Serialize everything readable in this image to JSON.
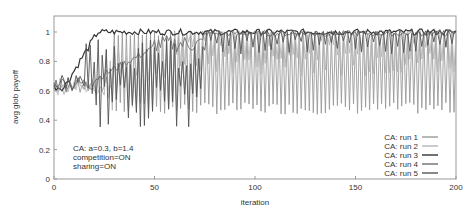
{
  "chart_data": {
    "type": "line",
    "title": "",
    "xlabel": "iteration",
    "ylabel": "avg glob payoff",
    "xlim": [
      0,
      200
    ],
    "ylim": [
      0,
      1.1
    ],
    "x_ticks": [
      "0",
      "50",
      "100",
      "150",
      "200"
    ],
    "y_ticks": [
      "0",
      "0.2",
      "0.4",
      "0.6",
      "0.8",
      "1"
    ],
    "grid": false,
    "legend_position": "lower-right",
    "annotation": [
      "CA: a=0.3, b=1.4",
      "competition=ON",
      "sharing=ON"
    ],
    "series": [
      {
        "name": "CA: run 1",
        "color": "#9a9a9a",
        "pattern": "oscillates between ~0.45 and ~1.0 from iteration ~30 to 200",
        "low": 0.45,
        "high": 1.0
      },
      {
        "name": "CA: run 2",
        "color": "#b5b5b5",
        "pattern": "rises from ~0.6 to ~1.0 by iteration ~60 with oscillations",
        "low": 0.55,
        "high": 1.0
      },
      {
        "name": "CA: run 3",
        "color": "#333333",
        "pattern": "rises from ~0.6 to ~1.0 by iteration ~22, stays near 1.0",
        "low": 0.6,
        "high": 1.0
      },
      {
        "name": "CA: run 4",
        "color": "#6e6e6e",
        "pattern": "rises to ~0.88 by iteration 50, reaches ~1.0 by ~75",
        "low": 0.6,
        "high": 1.0
      },
      {
        "name": "CA: run 5",
        "color": "#555555",
        "pattern": "oscillates 0.35-0.9 early, converges ~1.0 after ~75",
        "low": 0.35,
        "high": 1.0
      }
    ]
  },
  "legend": {
    "items": [
      "CA: run 1",
      "CA: run 2",
      "CA: run 3",
      "CA: run 4",
      "CA: run 5"
    ]
  },
  "annotation": {
    "line1": "CA: a=0.3, b=1.4",
    "line2": "competition=ON",
    "line3": "sharing=ON"
  },
  "axes": {
    "xlabel": "iteration",
    "ylabel": "avg glob payoff",
    "x_ticks": [
      "0",
      "50",
      "100",
      "150",
      "200"
    ],
    "y_ticks": [
      "0",
      "0.2",
      "0.4",
      "0.6",
      "0.8",
      "1"
    ]
  }
}
